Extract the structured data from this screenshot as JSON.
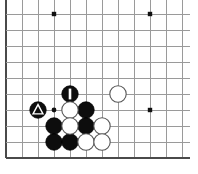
{
  "diagram": {
    "board": {
      "type": "go-goban",
      "visible_columns": 12,
      "visible_rows": 10,
      "cell_size_px": 16,
      "origin_x_px": 6,
      "origin_y_px": 14,
      "edges": [
        "left",
        "bottom"
      ],
      "line_color": "#9a9a9a",
      "edge_color": "#4a4a4a",
      "background_color": "#ffffff"
    },
    "star_points": [
      {
        "name": "star-point-top-left",
        "x": 54,
        "y": 14
      },
      {
        "name": "star-point-top-right",
        "x": 150,
        "y": 14
      },
      {
        "name": "star-point-right",
        "x": 150,
        "y": 110
      }
    ],
    "stones": [
      {
        "name": "stone-black-triangle",
        "color": "black",
        "x": 38,
        "y": 110,
        "mark": "triangle",
        "label": ""
      },
      {
        "name": "stone-black-move-1",
        "color": "black",
        "x": 70,
        "y": 94,
        "mark": "number",
        "label": "1"
      },
      {
        "name": "stone-black-a",
        "color": "black",
        "x": 86,
        "y": 110,
        "mark": "none",
        "label": ""
      },
      {
        "name": "stone-black-b",
        "color": "black",
        "x": 54,
        "y": 126,
        "mark": "none",
        "label": ""
      },
      {
        "name": "stone-black-c",
        "color": "black",
        "x": 86,
        "y": 126,
        "mark": "none",
        "label": ""
      },
      {
        "name": "stone-black-d",
        "color": "black",
        "x": 54,
        "y": 142,
        "mark": "none",
        "label": ""
      },
      {
        "name": "stone-black-e",
        "color": "black",
        "x": 70,
        "y": 142,
        "mark": "none",
        "label": ""
      },
      {
        "name": "stone-white-a",
        "color": "white",
        "x": 118,
        "y": 94,
        "mark": "none",
        "label": ""
      },
      {
        "name": "stone-white-b",
        "color": "white",
        "x": 70,
        "y": 110,
        "mark": "none",
        "label": ""
      },
      {
        "name": "stone-white-c",
        "color": "white",
        "x": 70,
        "y": 126,
        "mark": "none",
        "label": ""
      },
      {
        "name": "stone-white-d",
        "color": "white",
        "x": 102,
        "y": 126,
        "mark": "none",
        "label": ""
      },
      {
        "name": "stone-white-e",
        "color": "white",
        "x": 86,
        "y": 142,
        "mark": "none",
        "label": ""
      },
      {
        "name": "stone-white-f",
        "color": "white",
        "x": 102,
        "y": 142,
        "mark": "none",
        "label": ""
      }
    ],
    "point_markers": [
      {
        "name": "marked-empty-point",
        "x": 54,
        "y": 110,
        "radius": 2.4
      }
    ],
    "stone_radius_px": 8.2,
    "vertical_lines_x": [
      6,
      22,
      38,
      54,
      70,
      86,
      102,
      118,
      134,
      150,
      166,
      182
    ],
    "horizontal_lines_y": [
      14,
      30,
      46,
      62,
      78,
      94,
      110,
      126,
      142,
      158
    ]
  }
}
